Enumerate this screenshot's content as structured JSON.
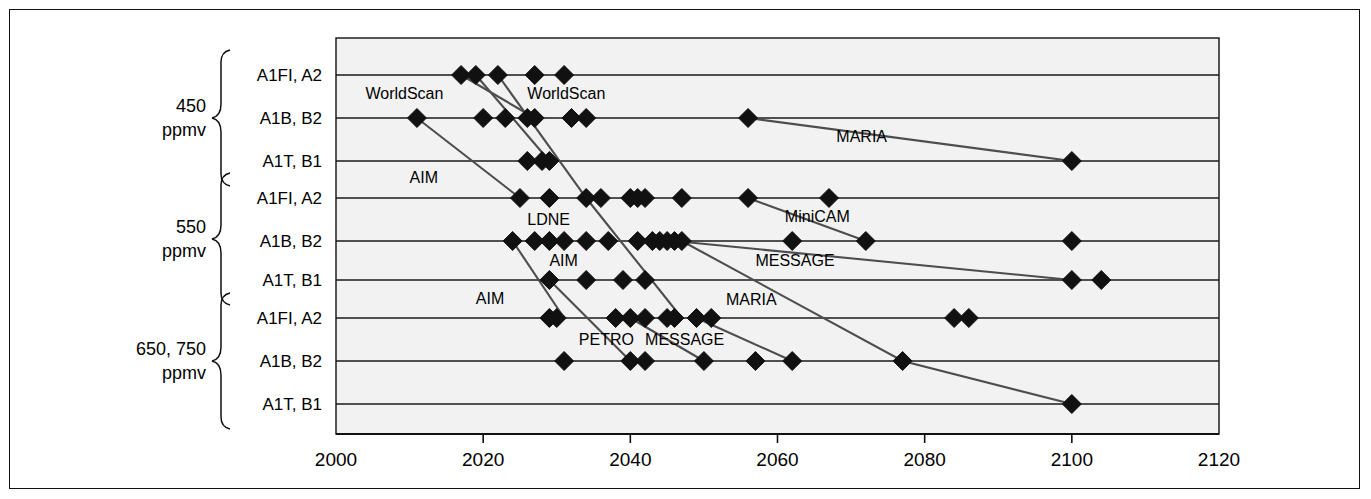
{
  "chart_data": {
    "type": "scatter",
    "title": "",
    "xlabel": "",
    "ylabel": "",
    "xlim": [
      2000,
      2120
    ],
    "xticks": [
      2000,
      2020,
      2040,
      2060,
      2080,
      2100,
      2120
    ],
    "xtick_labels": [
      "2000",
      "2020",
      "2040",
      "2060",
      "2080",
      "2100",
      "2120"
    ],
    "grid": true,
    "grid_orientation": "horizontal",
    "legend": "inline-annotations",
    "marker": "filled-diamond",
    "marker_color": "#111111",
    "line_color": "#4d4d4d",
    "plot_background": "#f2f2f2",
    "groups": [
      {
        "label": "450\nppmv",
        "label_line1": "450",
        "label_line2": "ppmv",
        "rows": [
          "A1FI, A2",
          "A1B, B2",
          "A1T, B1"
        ]
      },
      {
        "label": "550\nppmv",
        "label_line1": "550",
        "label_line2": "ppmv",
        "rows": [
          "A1FI, A2",
          "A1B, B2",
          "A1T, B1"
        ]
      },
      {
        "label": "650, 750\nppmv",
        "label_line1": "650, 750",
        "label_line2": "ppmv",
        "rows": [
          "A1FI, A2",
          "A1B, B2",
          "A1T, B1"
        ]
      }
    ],
    "rows": [
      {
        "id": "r0",
        "group": "450 ppmv",
        "category": "A1FI, A2",
        "values": [
          2017,
          2019,
          2022,
          2027,
          2031
        ]
      },
      {
        "id": "r1",
        "group": "450 ppmv",
        "category": "A1B, B2",
        "values": [
          2011,
          2020,
          2023,
          2026,
          2027,
          2032,
          2034,
          2056
        ]
      },
      {
        "id": "r2",
        "group": "450 ppmv",
        "category": "A1T, B1",
        "values": [
          2026,
          2028,
          2029,
          2100
        ]
      },
      {
        "id": "r3",
        "group": "550 ppmv",
        "category": "A1FI, A2",
        "values": [
          2025,
          2029,
          2034,
          2036,
          2040,
          2041,
          2042,
          2047,
          2056,
          2067
        ]
      },
      {
        "id": "r4",
        "group": "550 ppmv",
        "category": "A1B, B2",
        "values": [
          2024,
          2027,
          2029,
          2031,
          2034,
          2037,
          2041,
          2043,
          2044,
          2045,
          2046,
          2047,
          2062,
          2072,
          2100
        ]
      },
      {
        "id": "r5",
        "group": "550 ppmv",
        "category": "A1T, B1",
        "values": [
          2029,
          2034,
          2039,
          2042,
          2100,
          2104
        ]
      },
      {
        "id": "r6",
        "group": "650, 750 ppmv",
        "category": "A1FI, A2",
        "values": [
          2029,
          2030,
          2038,
          2040,
          2042,
          2045,
          2046,
          2049,
          2051,
          2084,
          2086
        ]
      },
      {
        "id": "r7",
        "group": "650, 750 ppmv",
        "category": "A1B, B2",
        "values": [
          2031,
          2040,
          2042,
          2050,
          2057,
          2062,
          2077
        ]
      },
      {
        "id": "r8",
        "group": "650, 750 ppmv",
        "category": "A1T, B1",
        "values": [
          2100
        ]
      }
    ],
    "trajectories": [
      {
        "name": "WorldScan",
        "points": [
          {
            "year": 2017,
            "row": 0
          },
          {
            "year": 2027,
            "row": 1
          }
        ]
      },
      {
        "name": "WorldScan",
        "points": [
          {
            "year": 2019,
            "row": 0
          },
          {
            "year": 2029,
            "row": 2
          }
        ]
      },
      {
        "name": "AIM",
        "points": [
          {
            "year": 2011,
            "row": 1
          },
          {
            "year": 2025,
            "row": 3
          }
        ]
      },
      {
        "name": "LDNE",
        "points": [
          {
            "year": 2022,
            "row": 0
          },
          {
            "year": 2034,
            "row": 3
          },
          {
            "year": 2047,
            "row": 6
          }
        ]
      },
      {
        "name": "AIM",
        "points": [
          {
            "year": 2024,
            "row": 4
          },
          {
            "year": 2031,
            "row": 6
          }
        ]
      },
      {
        "name": "AIM",
        "points": [
          {
            "year": 2029,
            "row": 5
          },
          {
            "year": 2040,
            "row": 7
          }
        ]
      },
      {
        "name": "MiniCAM",
        "points": [
          {
            "year": 2056,
            "row": 3
          },
          {
            "year": 2072,
            "row": 4
          }
        ]
      },
      {
        "name": "MESSAGE",
        "points": [
          {
            "year": 2046,
            "row": 4
          },
          {
            "year": 2100,
            "row": 5
          }
        ]
      },
      {
        "name": "MESSAGE",
        "points": [
          {
            "year": 2049,
            "row": 6
          },
          {
            "year": 2062,
            "row": 7
          }
        ]
      },
      {
        "name": "MARIA",
        "points": [
          {
            "year": 2056,
            "row": 1
          },
          {
            "year": 2100,
            "row": 2
          }
        ]
      },
      {
        "name": "MARIA",
        "points": [
          {
            "year": 2047,
            "row": 4
          },
          {
            "year": 2077,
            "row": 7
          },
          {
            "year": 2100,
            "row": 8
          }
        ]
      },
      {
        "name": "PETRO",
        "points": [
          {
            "year": 2040,
            "row": 6
          },
          {
            "year": 2050,
            "row": 7
          }
        ]
      }
    ],
    "annotations": [
      {
        "text": "WorldScan",
        "x": 2004,
        "row_pos": 0.45
      },
      {
        "text": "WorldScan",
        "x": 2026,
        "row_pos": 0.45
      },
      {
        "text": "MARIA",
        "x": 2068,
        "row_pos": 1.45
      },
      {
        "text": "AIM",
        "x": 2010,
        "row_pos": 2.45
      },
      {
        "text": "MiniCAM",
        "x": 2061,
        "row_pos": 3.45
      },
      {
        "text": "LDNE",
        "x": 2026,
        "row_pos": 3.5
      },
      {
        "text": "AIM",
        "x": 2029,
        "row_pos": 4.5
      },
      {
        "text": "MESSAGE",
        "x": 2057,
        "row_pos": 4.52
      },
      {
        "text": "AIM",
        "x": 2019,
        "row_pos": 5.5
      },
      {
        "text": "MARIA",
        "x": 2053,
        "row_pos": 5.52
      },
      {
        "text": "PETRO",
        "x": 2033,
        "row_pos": 6.5
      },
      {
        "text": "MESSAGE",
        "x": 2042,
        "row_pos": 6.5
      }
    ]
  }
}
